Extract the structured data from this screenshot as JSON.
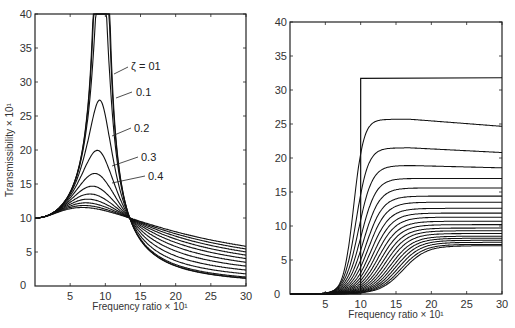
{
  "chart_data": [
    {
      "type": "line",
      "title": "",
      "xlabel": "Frequency ratio × 10¹",
      "ylabel": "Transmissibility × 10¹",
      "xlim": [
        0,
        30
      ],
      "ylim": [
        0,
        40
      ],
      "xticks": [
        "0",
        "5",
        "10",
        "15",
        "20",
        "25",
        "30"
      ],
      "yticks": [
        "10",
        "15",
        "20",
        "25",
        "30",
        "35",
        "40"
      ],
      "grid": false,
      "annotations": [
        {
          "text": "ζ = 01",
          "x": 13.5,
          "y": 31.7
        },
        {
          "text": "0.1",
          "x": 14.5,
          "y": 28.5
        },
        {
          "text": "0.2",
          "x": 14.5,
          "y": 23.5
        },
        {
          "text": "0.3",
          "x": 15.2,
          "y": 19
        },
        {
          "text": "0.4",
          "x": 15.2,
          "y": 16
        }
      ],
      "series_note": "Family of damping curves; all pass through (0,10) and cross at (14.1,10)",
      "series": [
        {
          "name": "ζ=0.01",
          "peak": 40
        },
        {
          "name": "ζ=0.05",
          "peak": 40
        },
        {
          "name": "ζ=0.1",
          "peak": 27
        },
        {
          "name": "ζ=0.2",
          "peak": 19.5
        },
        {
          "name": "ζ=0.3",
          "peak": 16.5
        },
        {
          "name": "ζ=0.4",
          "peak": 14.7
        },
        {
          "name": "ζ=0.5",
          "peak": 13.4
        },
        {
          "name": "ζ=0.6",
          "peak": 12.4
        },
        {
          "name": "ζ=0.7",
          "peak": 11.7
        },
        {
          "name": "ζ=0.8",
          "peak": 11.2
        },
        {
          "name": "ζ=0.9",
          "peak": 10.9
        },
        {
          "name": "ζ=1.0",
          "peak": 10.6
        }
      ]
    },
    {
      "type": "line",
      "title": "",
      "xlabel": "Frequency ratio × 10¹",
      "ylabel": "",
      "xlim": [
        0,
        30
      ],
      "ylim": [
        0,
        40
      ],
      "xticks": [
        "0",
        "5",
        "10",
        "15",
        "20",
        "25",
        "30"
      ],
      "yticks": [
        "5",
        "10",
        "15",
        "20",
        "25",
        "30",
        "35",
        "40"
      ],
      "grid": false,
      "series_note": "Step curve rising vertically at x=10 to ~31.7; family of curves plateauing at decreasing levels",
      "series": [
        {
          "name": "step",
          "plateau": 31.7
        },
        {
          "name": "c1",
          "plateau": 25.7
        },
        {
          "name": "c2",
          "plateau": 21.5
        },
        {
          "name": "c3",
          "plateau": 18.9
        },
        {
          "name": "c4",
          "plateau": 17.0
        },
        {
          "name": "c5",
          "plateau": 15.6
        },
        {
          "name": "c6",
          "plateau": 14.4
        },
        {
          "name": "c7",
          "plateau": 13.5
        },
        {
          "name": "c8",
          "plateau": 12.6
        },
        {
          "name": "c9",
          "plateau": 11.9
        },
        {
          "name": "c10",
          "plateau": 11.3
        },
        {
          "name": "c11",
          "plateau": 10.7
        },
        {
          "name": "c12",
          "plateau": 10.2
        },
        {
          "name": "c13",
          "plateau": 9.7
        },
        {
          "name": "c14",
          "plateau": 9.3
        },
        {
          "name": "c15",
          "plateau": 8.9
        },
        {
          "name": "c16",
          "plateau": 8.5
        },
        {
          "name": "c17",
          "plateau": 8.2
        },
        {
          "name": "c18",
          "plateau": 7.9
        },
        {
          "name": "c19",
          "plateau": 7.6
        },
        {
          "name": "c20",
          "plateau": 7.3
        },
        {
          "name": "c21",
          "plateau": 7.1
        }
      ]
    }
  ],
  "left": {
    "xlabel": "Frequency ratio × 10¹",
    "ylabel": "Transmissibility × 10¹",
    "xticks": [
      "0",
      "5",
      "10",
      "15",
      "20",
      "25",
      "30"
    ],
    "yticks": [
      "10",
      "15",
      "20",
      "25",
      "30",
      "35",
      "40"
    ],
    "ann": [
      "ζ = 01",
      "0.1",
      "0.2",
      "0.3",
      "0.4"
    ]
  },
  "right": {
    "xlabel": "Frequency ratio × 10¹",
    "xticks": [
      "0",
      "5",
      "10",
      "15",
      "20",
      "25",
      "30"
    ],
    "yticks": [
      "5",
      "10",
      "15",
      "20",
      "25",
      "30",
      "35",
      "40"
    ]
  }
}
